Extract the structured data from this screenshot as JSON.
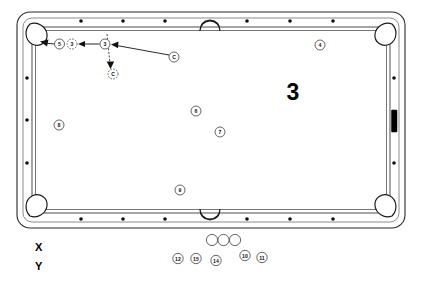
{
  "figure": {
    "number_label": "3",
    "axis_x_label": "X",
    "axis_y_label": "Y"
  },
  "table": {
    "name": "pool-table",
    "felt_color": "#ffffff",
    "rail_color": "#6f6f6f",
    "outline_color": "#2b2b2b",
    "diamond_color": "#111111",
    "side_marker_color": "#000000",
    "bed": {
      "x": 32,
      "y": 27,
      "w": 358,
      "h": 186
    },
    "outer": {
      "x": 17,
      "y": 12,
      "w": 388,
      "h": 216,
      "radius": 13
    },
    "top_rail_diamonds_count": 6,
    "bottom_rail_diamonds_count": 6,
    "left_rail_diamonds_count": 3,
    "right_rail_diamonds_count": 3
  },
  "balls_on_table": [
    {
      "id": "ball-5",
      "label": "5",
      "cx": 59.5,
      "cy": 44.0,
      "r": 5.0,
      "style": "solid"
    },
    {
      "id": "ball-3-pocketed",
      "label": "3",
      "cx": 72.0,
      "cy": 44.0,
      "r": 5.0,
      "style": "ghost"
    },
    {
      "id": "ball-3",
      "label": "3",
      "cx": 105.0,
      "cy": 44.0,
      "r": 5.0,
      "style": "solid"
    },
    {
      "id": "ball-c-ghost",
      "label": "C",
      "cx": 113.0,
      "cy": 74.0,
      "r": 5.0,
      "style": "ghost"
    },
    {
      "id": "ball-c",
      "label": "C",
      "cx": 174.0,
      "cy": 57.0,
      "r": 5.0,
      "style": "solid"
    },
    {
      "id": "ball-4",
      "label": "4",
      "cx": 320.0,
      "cy": 45.0,
      "r": 5.0,
      "style": "solid"
    },
    {
      "id": "ball-8",
      "label": "8",
      "cx": 59.0,
      "cy": 125.0,
      "r": 5.0,
      "style": "solid"
    },
    {
      "id": "ball-6",
      "label": "6",
      "cx": 196.0,
      "cy": 111.0,
      "r": 5.0,
      "style": "solid"
    },
    {
      "id": "ball-7",
      "label": "7",
      "cx": 220.0,
      "cy": 132.0,
      "r": 5.0,
      "style": "solid"
    },
    {
      "id": "ball-9",
      "label": "9",
      "cx": 180.0,
      "cy": 190.0,
      "r": 5.0,
      "style": "solid"
    }
  ],
  "balls_off_table": {
    "plain_circles": [
      {
        "id": "cue-blank-1",
        "cx": 212.0,
        "cy": 240.0,
        "r": 5.6
      },
      {
        "id": "cue-blank-2",
        "cx": 223.5,
        "cy": 240.0,
        "r": 5.6
      },
      {
        "id": "cue-blank-3",
        "cx": 235.0,
        "cy": 240.0,
        "r": 5.6
      }
    ],
    "numbered": [
      {
        "id": "rack-ball-12",
        "label": "12",
        "cx": 178.0,
        "cy": 258.5,
        "r": 5.2
      },
      {
        "id": "rack-ball-15",
        "label": "15",
        "cx": 196.0,
        "cy": 258.5,
        "r": 5.2
      },
      {
        "id": "rack-ball-14",
        "label": "14",
        "cx": 216.0,
        "cy": 260.5,
        "r": 5.2
      },
      {
        "id": "rack-ball-10",
        "label": "10",
        "cx": 245.0,
        "cy": 255.5,
        "r": 5.2
      },
      {
        "id": "rack-ball-11",
        "label": "11",
        "cx": 262.0,
        "cy": 257.5,
        "r": 5.2
      }
    ]
  },
  "shot_paths": [
    {
      "id": "cue-to-three",
      "from": "C",
      "to": "3",
      "description": "cue ball travel line to the 3 ball"
    },
    {
      "id": "three-to-pocketed",
      "from": "3",
      "to": "3-ghost",
      "description": "3 ball path toward the left pocket"
    },
    {
      "id": "pocket-entry",
      "from": "5",
      "to": "corner-pocket",
      "description": "ball entering the top-left corner pocket"
    },
    {
      "id": "cue-follow",
      "from": "3",
      "to": "C-ghost",
      "description": "cue ball resting position after contact"
    }
  ]
}
